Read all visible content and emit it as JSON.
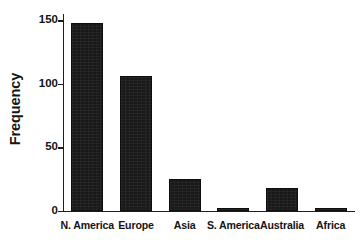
{
  "chart_data": {
    "type": "bar",
    "title": "",
    "xlabel": "",
    "ylabel": "Frequency",
    "categories": [
      "N. America",
      "Europe",
      "Asia",
      "S. America",
      "Australia",
      "Africa"
    ],
    "values": [
      148,
      106,
      25,
      2,
      18,
      2
    ],
    "ylim": [
      0,
      155
    ],
    "yticks": [
      0,
      50,
      100,
      150
    ],
    "ytick_labels": [
      "0",
      "50",
      "100",
      "150"
    ],
    "grid": false,
    "legend": null,
    "bar_color": "#191919",
    "axis_color": "#1d1d1d",
    "background_color": "#ffffff"
  }
}
